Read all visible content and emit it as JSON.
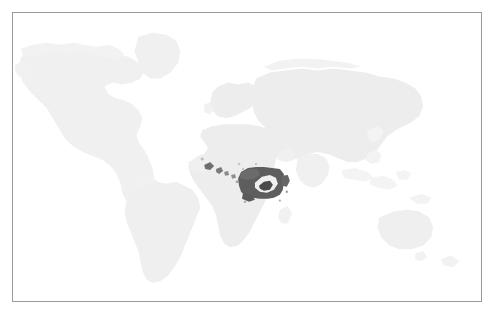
{
  "figure": {
    "kind": "world-map",
    "title": "",
    "width_px": 494,
    "height_px": 314,
    "background_color": "#ffffff",
    "frame": {
      "visible": true,
      "border_color": "#9a9a9a",
      "border_width_px": 1,
      "left_px": 12,
      "top_px": 12,
      "width_px": 470,
      "height_px": 290
    }
  },
  "legend": {
    "visible": false,
    "entries": []
  },
  "axes": {
    "visible": false,
    "tick_labels": []
  },
  "annotations": [],
  "colors": {
    "land_fill": "#ededed",
    "land_fill_faint": "#f2f2f2",
    "highlight_fill": "#5e5e5e",
    "highlight_inner": "#f2f2f2",
    "ocean_fill": "#ffffff",
    "frame_stroke": "#9a9a9a"
  },
  "chart_data": {
    "type": "map",
    "projection": "equirectangular",
    "title": "",
    "xlabel": "",
    "ylabel": "",
    "grid": false,
    "legend_position": "none",
    "value_scale": {
      "unhighlighted_label": "not highlighted",
      "highlighted_label": "highlighted"
    },
    "regions": [
      {
        "name": "North America",
        "highlighted": false,
        "fill": "#f0f0f0"
      },
      {
        "name": "Greenland",
        "highlighted": false,
        "fill": "#f0f0f0"
      },
      {
        "name": "South America",
        "highlighted": false,
        "fill": "#efefef"
      },
      {
        "name": "Europe",
        "highlighted": false,
        "fill": "#ededed"
      },
      {
        "name": "Asia",
        "highlighted": false,
        "fill": "#ededed"
      },
      {
        "name": "Africa",
        "highlighted": false,
        "fill": "#ededed"
      },
      {
        "name": "Australia",
        "highlighted": false,
        "fill": "#efefef"
      },
      {
        "name": "Southeast Asia islands",
        "highlighted": false,
        "fill": "#f3f3f3"
      },
      {
        "name": "Central Africa highlight",
        "highlighted": true,
        "fill": "#5e5e5e"
      },
      {
        "name": "West Africa coastal highlight",
        "highlighted": true,
        "fill": "#6a6a6a"
      }
    ],
    "highlighted_regions": [
      "Cameroon",
      "Central African Republic",
      "Equatorial Guinea",
      "Gabon",
      "Republic of the Congo",
      "Democratic Republic of the Congo"
    ],
    "highlight_center_px": {
      "x": 258,
      "y": 181
    },
    "highlight_bbox_px": {
      "x": 240,
      "y": 168,
      "w": 38,
      "h": 26
    }
  }
}
